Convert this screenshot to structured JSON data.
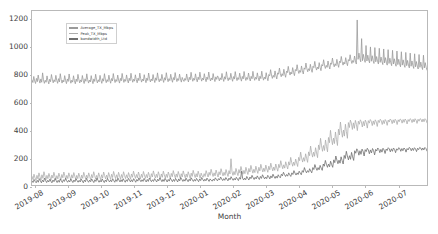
{
  "chart_data": {
    "type": "line",
    "title": "",
    "xlabel": "Month",
    "ylabel": "",
    "ylim": [
      0,
      1260
    ],
    "yticks": [
      0,
      200,
      400,
      600,
      800,
      1000,
      1200
    ],
    "xticklabels": [
      "2019-08",
      "2019-09",
      "2019-10",
      "2019-11",
      "2019-12",
      "2020-01",
      "2020-02",
      "2020-03",
      "2020-04",
      "2020-05",
      "2020-06",
      "2020-07"
    ],
    "grid": false,
    "legend_position": "upper left",
    "colors": {
      "average_tx": "#9a9a9a",
      "peak_tx": "#adadad",
      "bandwidth": "#6f6f6f",
      "axis": "#b9b9b9",
      "text": "#3f3f3f",
      "background": "#ffffff"
    },
    "series": [
      {
        "name": "Average_TX_Mbps",
        "color": "#9a9a9a",
        "values": [
          760,
          742,
          786,
          754,
          735,
          772,
          748,
          796,
          760,
          738,
          768,
          744,
          812,
          762,
          736,
          758,
          744,
          790,
          756,
          732,
          766,
          748,
          800,
          766,
          740,
          762,
          748,
          794,
          758,
          736,
          770,
          746,
          806,
          764,
          738,
          760,
          746,
          792,
          757,
          734,
          768,
          750,
          804,
          762,
          737,
          759,
          745,
          791,
          756,
          733,
          767,
          749,
          801,
          765,
          739,
          761,
          747,
          793,
          758,
          735,
          769,
          751,
          805,
          763,
          738,
          760,
          746,
          792,
          757,
          734,
          768,
          750,
          802,
          764,
          739,
          762,
          748,
          794,
          759,
          736,
          770,
          752,
          806,
          766,
          741,
          763,
          749,
          795,
          760,
          737,
          771,
          753,
          807,
          767,
          742,
          764,
          750,
          796,
          761,
          738,
          772,
          754,
          808,
          768,
          743,
          765,
          751,
          797,
          762,
          739,
          773,
          755,
          809,
          769,
          744,
          766,
          752,
          798,
          763,
          740,
          774,
          756,
          810,
          770,
          745,
          767,
          753,
          799,
          764,
          741,
          775,
          757,
          811,
          771,
          746,
          768,
          754,
          800,
          765,
          742,
          776,
          758,
          812,
          772,
          747,
          769,
          755,
          801,
          766,
          743,
          777,
          759,
          813,
          773,
          748,
          770,
          756,
          802,
          767,
          744,
          778,
          760,
          814,
          774,
          749,
          771,
          757,
          803,
          768,
          745,
          779,
          761,
          750,
          772,
          758,
          804,
          769,
          746,
          780,
          762,
          816,
          775,
          751,
          773,
          759,
          805,
          770,
          747,
          781,
          763,
          817,
          776,
          752,
          774,
          760,
          806,
          771,
          748,
          782,
          764,
          818,
          777,
          753,
          775,
          761,
          807,
          772,
          749,
          783,
          765,
          790,
          778,
          754,
          776,
          762,
          808,
          773,
          750,
          784,
          766,
          820,
          779,
          755,
          777,
          763,
          809,
          774,
          751,
          785,
          767,
          821,
          780,
          756,
          778,
          764,
          810,
          775,
          752,
          786,
          768,
          822,
          781,
          757,
          779,
          765,
          811,
          776,
          753,
          787,
          769,
          823,
          782,
          758,
          780,
          766,
          812,
          777,
          754,
          788,
          770,
          824,
          783,
          759,
          781,
          767,
          813,
          778,
          755,
          800,
          790,
          835,
          796,
          772,
          794,
          780,
          826,
          791,
          768,
          812,
          802,
          847,
          808,
          784,
          806,
          792,
          838,
          803,
          780,
          824,
          814,
          859,
          820,
          796,
          818,
          804,
          850,
          815,
          792,
          836,
          826,
          871,
          832,
          808,
          830,
          816,
          862,
          827,
          804,
          848,
          838,
          883,
          844,
          820,
          842,
          828,
          874,
          839,
          816,
          860,
          850,
          895,
          856,
          832,
          854,
          840,
          886,
          851,
          828,
          872,
          862,
          907,
          868,
          844,
          866,
          852,
          898,
          863,
          840,
          884,
          874,
          919,
          880,
          856,
          878,
          864,
          910,
          875,
          852,
          896,
          886,
          931,
          892,
          868,
          890,
          876,
          922,
          887,
          864,
          908,
          898,
          943,
          904,
          880,
          902,
          888,
          934,
          899,
          876,
          1195,
          910,
          955,
          916,
          892,
          1060,
          900,
          946,
          911,
          888,
          1010,
          898,
          940,
          905,
          884,
          1000,
          896,
          936,
          901,
          880,
          995,
          892,
          930,
          897,
          876,
          990,
          888,
          926,
          893,
          872,
          985,
          884,
          922,
          889,
          868,
          980,
          880,
          918,
          885,
          864,
          975,
          876,
          914,
          881,
          860,
          970,
          872,
          910,
          877,
          856,
          965,
          868,
          906,
          873,
          852,
          960,
          864,
          902,
          869,
          848,
          955,
          860,
          898,
          865,
          844,
          950,
          856,
          894,
          861,
          840,
          945,
          852,
          890,
          857,
          836,
          940,
          848,
          886,
          853,
          832
        ]
      },
      {
        "name": "Peak_TX_Mbps",
        "color": "#adadad",
        "values": [
          62,
          40,
          78,
          52,
          34,
          70,
          44,
          88,
          60,
          36,
          74,
          48,
          96,
          66,
          38,
          70,
          46,
          84,
          58,
          34,
          72,
          50,
          92,
          64,
          38,
          68,
          44,
          86,
          60,
          36,
          76,
          52,
          94,
          66,
          40,
          70,
          46,
          88,
          62,
          38,
          74,
          50,
          90,
          64,
          40,
          70,
          46,
          86,
          60,
          36,
          72,
          48,
          92,
          66,
          42,
          72,
          48,
          88,
          62,
          38,
          76,
          52,
          96,
          68,
          42,
          70,
          46,
          88,
          62,
          38,
          74,
          50,
          94,
          68,
          44,
          72,
          48,
          90,
          64,
          40,
          78,
          54,
          98,
          70,
          46,
          74,
          50,
          92,
          66,
          42,
          76,
          52,
          96,
          70,
          46,
          74,
          50,
          90,
          66,
          42,
          80,
          56,
          100,
          72,
          48,
          76,
          52,
          94,
          68,
          44,
          78,
          54,
          98,
          72,
          48,
          76,
          52,
          92,
          68,
          44,
          82,
          58,
          102,
          74,
          50,
          78,
          54,
          96,
          70,
          46,
          80,
          56,
          100,
          74,
          50,
          78,
          54,
          94,
          70,
          46,
          84,
          60,
          104,
          76,
          52,
          80,
          56,
          98,
          72,
          48,
          82,
          58,
          102,
          76,
          52,
          80,
          56,
          96,
          72,
          48,
          86,
          62,
          106,
          78,
          54,
          82,
          58,
          100,
          74,
          50,
          86,
          66,
          56,
          82,
          62,
          104,
          80,
          58,
          92,
          70,
          114,
          86,
          62,
          88,
          66,
          108,
          82,
          58,
          96,
          74,
          118,
          90,
          66,
          92,
          70,
          112,
          86,
          62,
          104,
          80,
          190,
          96,
          70,
          98,
          74,
          120,
          92,
          68,
          112,
          86,
          134,
          104,
          78,
          106,
          82,
          128,
          100,
          76,
          120,
          94,
          142,
          112,
          86,
          114,
          90,
          136,
          108,
          84,
          128,
          102,
          150,
          120,
          94,
          122,
          98,
          144,
          116,
          92,
          136,
          110,
          158,
          128,
          102,
          130,
          106,
          152,
          124,
          100,
          150,
          126,
          176,
          144,
          118,
          146,
          122,
          168,
          140,
          116,
          168,
          144,
          200,
          164,
          136,
          166,
          142,
          188,
          160,
          134,
          200,
          176,
          238,
          196,
          166,
          198,
          172,
          226,
          192,
          164,
          240,
          212,
          282,
          236,
          202,
          238,
          208,
          270,
          232,
          198,
          290,
          256,
          338,
          284,
          244,
          286,
          250,
          326,
          278,
          240,
          344,
          306,
          396,
          338,
          292,
          340,
          300,
          384,
          330,
          286,
          404,
          362,
          456,
          396,
          346,
          398,
          354,
          440,
          386,
          338,
          452,
          416,
          470,
          448,
          402,
          450,
          410,
          468,
          440,
          394,
          462,
          440,
          472,
          458,
          420,
          460,
          428,
          470,
          452,
          412,
          466,
          448,
          474,
          462,
          430,
          464,
          438,
          472,
          458,
          424,
          468,
          452,
          476,
          466,
          438,
          468,
          444,
          474,
          462,
          432,
          470,
          456,
          478,
          470,
          444,
          472,
          450,
          476,
          466,
          438,
          472,
          458,
          478,
          472,
          448,
          474,
          454,
          478,
          468,
          442,
          474,
          460,
          480,
          474,
          452,
          476,
          456,
          480,
          470,
          446,
          476,
          462,
          480,
          476,
          456,
          478,
          458,
          480,
          472,
          450
        ]
      },
      {
        "name": "bandwidth_Ltd",
        "color": "#6f6f6f",
        "values": [
          30,
          18,
          40,
          26,
          16,
          34,
          20,
          46,
          30,
          16,
          36,
          22,
          50,
          32,
          18,
          34,
          22,
          42,
          28,
          16,
          36,
          24,
          48,
          32,
          18,
          34,
          20,
          44,
          30,
          18,
          38,
          26,
          48,
          32,
          20,
          34,
          22,
          44,
          30,
          18,
          36,
          24,
          46,
          32,
          20,
          34,
          22,
          42,
          30,
          16,
          36,
          24,
          48,
          32,
          20,
          36,
          24,
          44,
          30,
          18,
          38,
          26,
          50,
          34,
          20,
          34,
          22,
          44,
          30,
          18,
          36,
          24,
          48,
          34,
          22,
          36,
          24,
          46,
          32,
          20,
          40,
          26,
          50,
          36,
          22,
          38,
          24,
          46,
          32,
          20,
          38,
          26,
          48,
          36,
          22,
          38,
          24,
          46,
          34,
          20,
          40,
          28,
          52,
          36,
          24,
          38,
          26,
          48,
          34,
          22,
          40,
          26,
          50,
          36,
          24,
          38,
          26,
          46,
          34,
          22,
          42,
          30,
          52,
          38,
          24,
          40,
          26,
          48,
          36,
          22,
          40,
          28,
          50,
          38,
          24,
          40,
          26,
          48,
          36,
          22,
          44,
          30,
          54,
          40,
          26,
          40,
          28,
          50,
          36,
          24,
          42,
          30,
          52,
          38,
          26,
          40,
          28,
          48,
          36,
          24,
          44,
          32,
          54,
          40,
          28,
          42,
          30,
          50,
          38,
          26,
          44,
          34,
          28,
          42,
          32,
          52,
          40,
          30,
          46,
          36,
          58,
          44,
          32,
          46,
          34,
          54,
          42,
          30,
          50,
          38,
          60,
          46,
          34,
          48,
          36,
          56,
          44,
          32,
          54,
          42,
          100,
          50,
          36,
          50,
          38,
          62,
          48,
          36,
          58,
          46,
          70,
          54,
          40,
          56,
          44,
          66,
          52,
          40,
          62,
          48,
          74,
          58,
          44,
          58,
          46,
          70,
          60,
          44,
          66,
          52,
          78,
          62,
          48,
          64,
          50,
          74,
          60,
          52,
          78,
          66,
          92,
          76,
          62,
          76,
          64,
          88,
          74,
          62,
          88,
          76,
          104,
          86,
          72,
          88,
          76,
          100,
          86,
          74,
          104,
          92,
          126,
          104,
          88,
          104,
          92,
          118,
          102,
          88,
          126,
          112,
          148,
          124,
          106,
          126,
          110,
          142,
          122,
          106,
          152,
          136,
          178,
          150,
          128,
          152,
          132,
          172,
          148,
          128,
          182,
          162,
          210,
          180,
          154,
          180,
          158,
          204,
          176,
          152,
          214,
          192,
          244,
          210,
          182,
          212,
          186,
          236,
          204,
          178,
          248,
          230,
          262,
          248,
          216,
          248,
          222,
          260,
          244,
          210,
          256,
          242,
          266,
          254,
          226,
          254,
          232,
          264,
          250,
          218,
          258,
          246,
          268,
          258,
          234,
          258,
          238,
          266,
          254,
          228,
          260,
          250,
          270,
          262,
          240,
          262,
          244,
          268,
          258,
          234,
          262,
          252,
          270,
          264,
          244,
          264,
          248,
          268,
          260,
          238,
          264,
          254,
          272,
          266,
          248,
          266,
          250,
          270,
          262,
          242,
          266,
          256,
          272,
          268,
          252,
          268,
          254,
          272,
          264,
          246
        ]
      }
    ]
  },
  "legend": {
    "items": [
      {
        "label": "Average_TX_Mbps"
      },
      {
        "label": "Peak_TX_Mbps"
      },
      {
        "label": "bandwidth_Ltd"
      }
    ]
  }
}
